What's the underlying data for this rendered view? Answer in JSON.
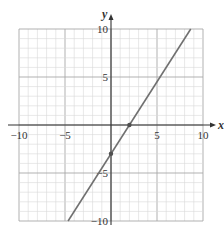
{
  "chart_data": {
    "type": "line",
    "title": "",
    "xlabel": "x",
    "ylabel": "y",
    "xlim": [
      -10,
      10
    ],
    "ylim": [
      -10,
      10
    ],
    "grid": true,
    "grid_minor_step": 1,
    "grid_major_step": 5,
    "x_ticks": [
      -10,
      -5,
      5,
      10
    ],
    "y_ticks": [
      10,
      5,
      -5,
      -10
    ],
    "x_tick_labels": [
      "−10",
      "−5",
      "5",
      "10"
    ],
    "y_tick_labels": [
      "10",
      "5",
      "−5",
      "−10"
    ],
    "series": [
      {
        "name": "line",
        "equation": "y = 1.5x − 3",
        "x": [
          -4.667,
          8.667
        ],
        "y": [
          -10,
          10
        ],
        "color": "#707070"
      }
    ],
    "points": [
      {
        "x": 2,
        "y": 0,
        "label": "x-intercept"
      },
      {
        "x": 0,
        "y": -3,
        "label": "y-intercept"
      }
    ],
    "colors": {
      "grid_minor": "#d8d8d8",
      "grid_major": "#a8a8a8",
      "axes": "#333333",
      "line": "#707070",
      "points": "#505050"
    }
  }
}
